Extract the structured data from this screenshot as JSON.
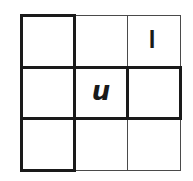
{
  "diagram": {
    "type": "3x3 letter grid puzzle",
    "rows": 3,
    "cols": 3,
    "cells": [
      [
        "",
        "",
        "l"
      ],
      [
        "",
        "u",
        ""
      ],
      [
        "",
        "",
        ""
      ]
    ],
    "highlighted_regions": [
      "left column (3 cells, thick border)",
      "middle row (3 cells, thick border)"
    ],
    "colors": {
      "line": "#1a1a1a",
      "thin_line": "#4a4a4a",
      "background": "#ffffff"
    }
  },
  "labels": {
    "top_right": "l",
    "center": "u"
  }
}
